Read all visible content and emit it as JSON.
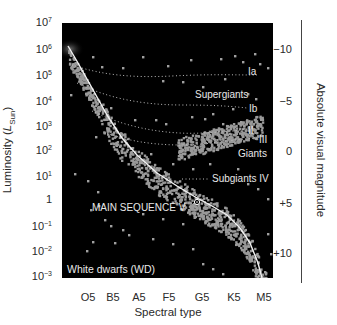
{
  "chart_data": {
    "type": "scatter",
    "title": "",
    "xlabel": "Spectral type",
    "ylabel": "Luminosity (L_Sun)",
    "ylabel_right": "Absolute visual magnitude",
    "x_tick_labels": [
      "O5",
      "B5",
      "A5",
      "F5",
      "G5",
      "K5",
      "M5"
    ],
    "y_tick_labels": [
      {
        "base": "10",
        "exp": "7"
      },
      {
        "base": "10",
        "exp": "6"
      },
      {
        "base": "10",
        "exp": "5"
      },
      {
        "base": "10",
        "exp": "4"
      },
      {
        "base": "10",
        "exp": "3"
      },
      {
        "base": "10",
        "exp": "2"
      },
      {
        "base": "10",
        "exp": "1"
      },
      {
        "base": "1",
        "exp": ""
      },
      {
        "base": "10",
        "exp": "−1"
      },
      {
        "base": "10",
        "exp": "−2"
      },
      {
        "base": "10",
        "exp": "−3"
      }
    ],
    "ylim": [
      0.001,
      10000000
    ],
    "yscale": "log",
    "right_tick_labels": [
      "−10",
      "−5",
      "0",
      "+5",
      "+10"
    ],
    "right_ylim": [
      12.5,
      -14
    ],
    "regions": [
      {
        "name": "Ia",
        "label": "Ia",
        "type": "luminosity-class-line"
      },
      {
        "name": "Supergiants",
        "label": "Supergiants",
        "type": "region-label"
      },
      {
        "name": "Ib",
        "label": "Ib",
        "type": "luminosity-class-line"
      },
      {
        "name": "II",
        "label": "II",
        "type": "luminosity-class-line"
      },
      {
        "name": "III",
        "label": "III",
        "type": "luminosity-class-line"
      },
      {
        "name": "Giants",
        "label": "Giants",
        "type": "region-label"
      },
      {
        "name": "Subgiants IV",
        "label": "Subgiants IV",
        "type": "luminosity-class-line"
      },
      {
        "name": "Main sequence V",
        "label": "MAIN SEQUENCE V",
        "type": "main-sequence-curve"
      },
      {
        "name": "White dwarfs",
        "label": "White dwarfs (WD)",
        "type": "region-label"
      }
    ],
    "main_sequence_curve_luminosity": {
      "O5": 800000,
      "B5": 800,
      "A5": 20,
      "F5": 3,
      "G5": 0.8,
      "K5": 0.15,
      "M5": 0.001
    },
    "sun_marker": {
      "spectral_type": "G2",
      "luminosity": 1
    },
    "grid": false,
    "legend": "none",
    "colors": {
      "background": "#000000",
      "stars": "#9a9a9a",
      "main_sequence_line": "#f2f2f2",
      "class_lines": "#bdbdbd",
      "text_inside": "#e8e8e8"
    }
  },
  "labels": {
    "ia": "Ia",
    "supergiants": "Supergiants",
    "ib": "Ib",
    "ii": "II",
    "iii": "III",
    "giants": "Giants",
    "subgiants": "Subgiants IV",
    "main_sequence": "MAIN SEQUENCE V",
    "white_dwarfs": "White dwarfs (WD)"
  }
}
